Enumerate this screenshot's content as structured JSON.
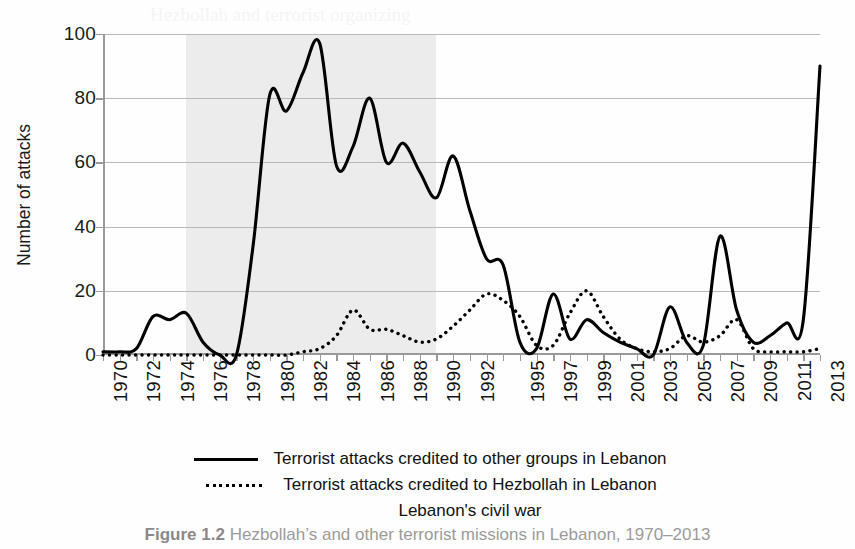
{
  "chart_data": {
    "type": "line",
    "title": "",
    "xlabel": "",
    "ylabel": "Number of attacks",
    "ylim": [
      0,
      100
    ],
    "yticks": [
      0,
      20,
      40,
      60,
      80,
      100
    ],
    "xlim": [
      1970,
      2013
    ],
    "x": [
      1970,
      1971,
      1972,
      1973,
      1974,
      1975,
      1976,
      1977,
      1978,
      1979,
      1980,
      1981,
      1982,
      1983,
      1984,
      1985,
      1986,
      1987,
      1988,
      1989,
      1990,
      1991,
      1992,
      1993,
      1994,
      1995,
      1996,
      1997,
      1998,
      1999,
      2000,
      2001,
      2002,
      2003,
      2004,
      2005,
      2006,
      2007,
      2008,
      2009,
      2010,
      2011,
      2012,
      2013
    ],
    "xtick_labels": [
      "1970",
      "1972",
      "1974",
      "1976",
      "1978",
      "1980",
      "1982",
      "1984",
      "1986",
      "1988",
      "1990",
      "1992",
      "1995",
      "1997",
      "1999",
      "2001",
      "2003",
      "2005",
      "2007",
      "2009",
      "2011",
      "2013"
    ],
    "grid": true,
    "legend_position": "below",
    "series": [
      {
        "name": "Terrorist attacks credited to other groups in Lebanon",
        "style": "solid",
        "color": "#000000",
        "values": [
          1,
          1,
          2,
          12,
          11,
          13,
          4,
          0,
          0,
          34,
          81,
          76,
          88,
          97,
          59,
          65,
          80,
          60,
          66,
          57,
          49,
          62,
          45,
          30,
          28,
          4,
          2,
          19,
          5,
          11,
          7,
          4,
          2,
          0,
          15,
          4,
          3,
          37,
          14,
          4,
          6,
          10,
          11,
          90
        ]
      },
      {
        "name": "Terrorist attacks credited to Hezbollah in Lebanon",
        "style": "dotted",
        "color": "#000000",
        "values": [
          0,
          0,
          0,
          0,
          0,
          0,
          0,
          0,
          0,
          0,
          0,
          0,
          1,
          2,
          6,
          14,
          8,
          8,
          6,
          4,
          5,
          9,
          14,
          19,
          17,
          12,
          3,
          3,
          13,
          20,
          12,
          5,
          2,
          1,
          2,
          6,
          4,
          6,
          11,
          2,
          1,
          1,
          1,
          2
        ]
      }
    ],
    "shaded_region": {
      "label": "Lebanon's civil war",
      "start": 1975,
      "end": 1990,
      "color": "#ececec"
    }
  },
  "legend": {
    "entries": [
      {
        "label": "Terrorist attacks credited to other groups in Lebanon",
        "marker": "solid-line"
      },
      {
        "label": "Terrorist attacks credited to Hezbollah in Lebanon",
        "marker": "dotted-line"
      },
      {
        "label": "Lebanon's civil war",
        "marker": "none"
      }
    ]
  },
  "caption": {
    "figure_number": "Figure 1.2",
    "text": "Hezbollah’s and other terrorist missions in Lebanon, 1970–2013"
  }
}
